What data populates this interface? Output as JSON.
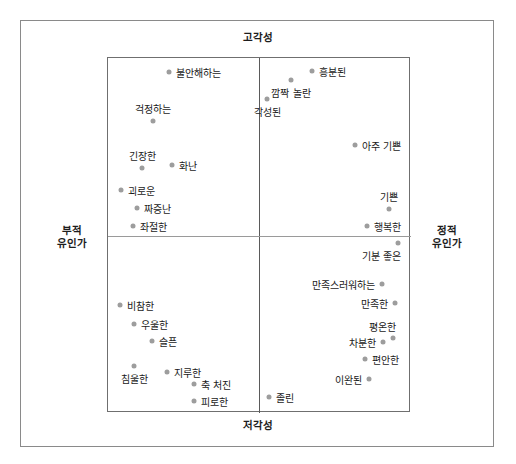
{
  "figure": {
    "title_present": false,
    "background_color": "#ffffff",
    "frame_color": "#8a8a8a",
    "point_color": "#9d9d9d",
    "text_color": "#1a1a1a"
  },
  "axes": {
    "top_label": "고각성",
    "bottom_label": "저각성",
    "left_label_line1": "부적",
    "left_label_line2": "유인가",
    "right_label_line1": "정적",
    "right_label_line2": "유인가"
  },
  "chart_data": {
    "type": "scatter",
    "title": "",
    "xlabel": "유인가 (Valence)",
    "ylabel": "각성 (Arousal)",
    "xlim": [
      -1,
      1
    ],
    "ylim": [
      -1,
      1
    ],
    "grid": false,
    "legend": null,
    "axis_annotations": {
      "top": "고각성",
      "bottom": "저각성",
      "left": "부적 유인가",
      "right": "정적 유인가"
    },
    "points": [
      {
        "label": "불안해하는",
        "px": 168,
        "py": 71,
        "label_side": "right"
      },
      {
        "label": "걱정하는",
        "px": 152,
        "py": 120,
        "label_side": "above"
      },
      {
        "label": "긴장한",
        "px": 141,
        "py": 167,
        "label_side": "above"
      },
      {
        "label": "화난",
        "px": 171,
        "py": 164,
        "label_side": "right"
      },
      {
        "label": "괴로운",
        "px": 120,
        "py": 189,
        "label_side": "right"
      },
      {
        "label": "짜증난",
        "px": 136,
        "py": 207,
        "label_side": "right"
      },
      {
        "label": "좌절한",
        "px": 132,
        "py": 225,
        "label_side": "right"
      },
      {
        "label": "흥분된",
        "px": 311,
        "py": 70,
        "label_side": "right"
      },
      {
        "label": "깜짝 놀란",
        "px": 290,
        "py": 79,
        "label_side": "below"
      },
      {
        "label": "각성된",
        "px": 266,
        "py": 98,
        "label_side": "below"
      },
      {
        "label": "아주 기쁜",
        "px": 354,
        "py": 144,
        "label_side": "right"
      },
      {
        "label": "기쁜",
        "px": 388,
        "py": 208,
        "label_side": "above"
      },
      {
        "label": "행복한",
        "px": 366,
        "py": 225,
        "label_side": "right"
      },
      {
        "label": "기분 좋은",
        "px": 397,
        "py": 242,
        "label_side": "below-left"
      },
      {
        "label": "만족스러워하는",
        "px": 381,
        "py": 283,
        "label_side": "left"
      },
      {
        "label": "만족한",
        "px": 394,
        "py": 302,
        "label_side": "left"
      },
      {
        "label": "평온한",
        "px": 392,
        "py": 337,
        "label_side": "above-left"
      },
      {
        "label": "차분한",
        "px": 382,
        "py": 341,
        "label_side": "left"
      },
      {
        "label": "편안한",
        "px": 364,
        "py": 358,
        "label_side": "right"
      },
      {
        "label": "이완된",
        "px": 368,
        "py": 378,
        "label_side": "left"
      },
      {
        "label": "졸린",
        "px": 268,
        "py": 396,
        "label_side": "right"
      },
      {
        "label": "비참한",
        "px": 119,
        "py": 304,
        "label_side": "right"
      },
      {
        "label": "우울한",
        "px": 133,
        "py": 323,
        "label_side": "right"
      },
      {
        "label": "슬픈",
        "px": 151,
        "py": 340,
        "label_side": "right"
      },
      {
        "label": "침울한",
        "px": 133,
        "py": 365,
        "label_side": "below"
      },
      {
        "label": "지루한",
        "px": 166,
        "py": 371,
        "label_side": "right"
      },
      {
        "label": "축 처진",
        "px": 193,
        "py": 383,
        "label_side": "right"
      },
      {
        "label": "피로한",
        "px": 193,
        "py": 400,
        "label_side": "right"
      }
    ]
  }
}
